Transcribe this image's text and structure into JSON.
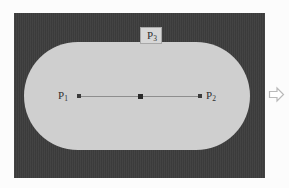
{
  "figure": {
    "caption_remnant": "",
    "background_color": "#fcfcfc",
    "frame": {
      "name": "outer-frame",
      "color": "#3d3d3d",
      "x": 14,
      "y": 13,
      "width": 251,
      "height": 165
    },
    "region": {
      "name": "stadium-shape",
      "shape": "stadium",
      "color": "#cfcfcf",
      "x": 24,
      "y": 42,
      "width": 226,
      "height": 108,
      "corner_radius": 54
    },
    "segment": {
      "name": "segment-p1-p2",
      "color": "#8e8e8e",
      "x1": 79,
      "y1": 96,
      "x2": 200,
      "y2": 96
    },
    "points": [
      {
        "id": "p1",
        "label": "P",
        "subscript": "1",
        "x": 79,
        "y": 96,
        "dot_color": "#3b3b3b"
      },
      {
        "id": "mid",
        "label": "",
        "subscript": "",
        "x": 140,
        "y": 96,
        "dot_color": "#2a2a2a"
      },
      {
        "id": "p2",
        "label": "P",
        "subscript": "2",
        "x": 200,
        "y": 96,
        "dot_color": "#3b3b3b"
      },
      {
        "id": "p3",
        "label": "P",
        "subscript": "3",
        "x": 151,
        "y": 35,
        "dot_color": "#2a2a2a"
      }
    ],
    "labels": {
      "p1_base": "P",
      "p1_sub": "1",
      "p2_base": "P",
      "p2_sub": "2",
      "p3_base": "P",
      "p3_sub": "3"
    },
    "arrow": {
      "name": "right-arrow-icon",
      "glyph": "right-arrow-outline",
      "color": "#b9b9b9",
      "x": 268,
      "y": 85
    }
  }
}
